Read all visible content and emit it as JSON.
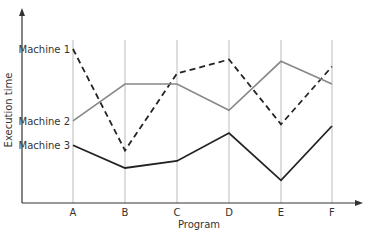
{
  "chart_data": {
    "type": "line",
    "title": "",
    "xlabel": "Program",
    "ylabel": "Execution time",
    "categories": [
      "A",
      "B",
      "C",
      "D",
      "E",
      "F"
    ],
    "grid": "vertical lines at each category",
    "legend": "inline labels at left of series start",
    "y_ticks": "none (qualitative)",
    "series": [
      {
        "name": "Machine 1",
        "style": "dashed black",
        "color": "#222222",
        "values": [
          0.88,
          0.3,
          0.74,
          0.82,
          0.45,
          0.78
        ]
      },
      {
        "name": "Machine 2",
        "style": "solid gray",
        "color": "#888888",
        "values": [
          0.47,
          0.68,
          0.68,
          0.53,
          0.81,
          0.68
        ]
      },
      {
        "name": "Machine 3",
        "style": "solid black",
        "color": "#222222",
        "values": [
          0.33,
          0.2,
          0.24,
          0.4,
          0.13,
          0.44
        ]
      }
    ],
    "ylim": [
      0,
      1
    ]
  },
  "labels": {
    "xlabel": "Program",
    "ylabel": "Execution time",
    "series": [
      "Machine 1",
      "Machine 2",
      "Machine 3"
    ],
    "categories": [
      "A",
      "B",
      "C",
      "D",
      "E",
      "F"
    ]
  }
}
